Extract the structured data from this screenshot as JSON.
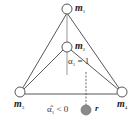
{
  "nodes": {
    "m1": {
      "label": "m",
      "sub": "1"
    },
    "m2": {
      "label": "m",
      "sub": "2"
    },
    "m3": {
      "label": "m",
      "sub": "3"
    },
    "m4": {
      "label": "m",
      "sub": "4"
    },
    "r": {
      "label": "r"
    }
  },
  "annotations": {
    "alpha1": "α",
    "alpha1_sub": "1",
    "alpha1_rel": " = 1",
    "alpha1hat": "α̂",
    "alpha1hat_sub": "1",
    "alpha1hat_rel": " < 0"
  },
  "colors": {
    "line": "#444444",
    "gray_line": "#aaaaaa",
    "r_fill": "#8a8a8a"
  }
}
